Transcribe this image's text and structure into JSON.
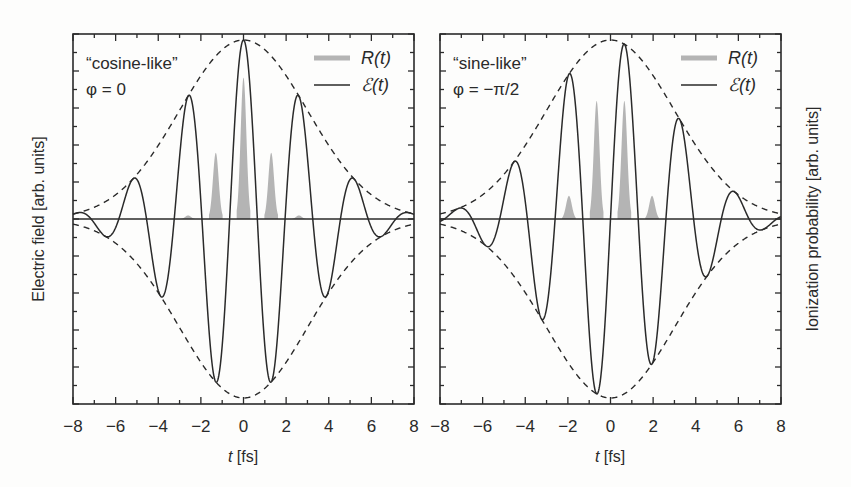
{
  "chart_data": [
    {
      "type": "line",
      "panel": "left",
      "annotation_line1": "“cosine-like”",
      "annotation_line2": "φ = 0",
      "xlabel": "t [fs]",
      "ylabel": "Electric field [arb. units]",
      "xlim": [
        -8,
        8
      ],
      "ylim": [
        -1,
        1
      ],
      "x_ticks": [
        "−8",
        "−6",
        "−4",
        "−2",
        "0",
        "2",
        "4",
        "6",
        "8"
      ],
      "legend": [
        {
          "name": "R(t)",
          "style": "gray filled"
        },
        {
          "name": "ℰ(t)",
          "style": "black solid"
        }
      ],
      "series": [
        {
          "name": "ℰ(t)",
          "carrier_period_fs": 2.6,
          "phase": 0,
          "envelope_sigma_fs": 3.0,
          "peaks_t": [
            -5.2,
            -2.6,
            0,
            2.6,
            5.2
          ],
          "troughs_t": [
            -6.5,
            -3.9,
            -1.3,
            1.3,
            3.9,
            6.5
          ]
        },
        {
          "name": "envelope",
          "style": "dashed",
          "peak": 1.0
        },
        {
          "name": "R(t)",
          "bursts": [
            {
              "t": -2.6,
              "height": 0.02
            },
            {
              "t": -1.3,
              "height": 0.37
            },
            {
              "t": 0.0,
              "height": 0.79
            },
            {
              "t": 1.3,
              "height": 0.37
            },
            {
              "t": 2.6,
              "height": 0.02
            }
          ]
        }
      ]
    },
    {
      "type": "line",
      "panel": "right",
      "annotation_line1": "“sine-like”",
      "annotation_line2": "φ = −π/2",
      "xlabel": "t [fs]",
      "ylabel": "Ionization probability [arb. units]",
      "xlim": [
        -8,
        8
      ],
      "ylim": [
        -1,
        1
      ],
      "x_ticks": [
        "−8",
        "−6",
        "−4",
        "−2",
        "0",
        "2",
        "4",
        "6",
        "8"
      ],
      "legend": [
        {
          "name": "R(t)",
          "style": "gray filled"
        },
        {
          "name": "ℰ(t)",
          "style": "black solid"
        }
      ],
      "series": [
        {
          "name": "ℰ(t)",
          "carrier_period_fs": 2.6,
          "phase": -1.5708,
          "envelope_sigma_fs": 3.0
        },
        {
          "name": "envelope",
          "style": "dashed",
          "peak": 1.0
        },
        {
          "name": "R(t)",
          "bursts": [
            {
              "t": -1.95,
              "height": 0.13
            },
            {
              "t": -0.65,
              "height": 0.66
            },
            {
              "t": 0.65,
              "height": 0.66
            },
            {
              "t": 1.95,
              "height": 0.13
            }
          ]
        }
      ]
    }
  ],
  "colors": {
    "line": "#2a2a2a",
    "fill": "#b4b4b4",
    "background": "#fdfdfc"
  }
}
